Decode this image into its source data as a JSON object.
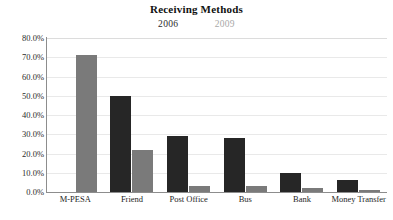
{
  "chart_data": {
    "type": "bar",
    "title": "Receiving Methods",
    "xlabel": "",
    "ylabel": "",
    "ylim": [
      0,
      80
    ],
    "ytick_labels": [
      "80.0%",
      "70.0%",
      "60.0%",
      "50.0%",
      "40.0%",
      "30.0%",
      "20.0%",
      "10.0%",
      "0.0%"
    ],
    "ytick_values": [
      80,
      70,
      60,
      50,
      40,
      30,
      20,
      10,
      0
    ],
    "grid": true,
    "legend_position": "top-center",
    "categories": [
      "M-PESA",
      "Friend",
      "Post Office",
      "Bus",
      "Bank",
      "Money Transfer"
    ],
    "series": [
      {
        "name": "2006",
        "color": "#262626",
        "values": [
          null,
          50,
          29,
          28,
          10,
          6
        ]
      },
      {
        "name": "2009",
        "color": "#7a7a7a",
        "values": [
          71,
          22,
          3,
          3,
          2,
          1
        ]
      }
    ]
  },
  "legend": {
    "entries": [
      {
        "label": "2006"
      },
      {
        "label": "2009"
      }
    ]
  }
}
